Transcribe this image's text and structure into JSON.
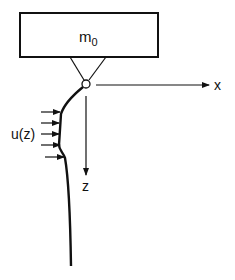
{
  "diagram": {
    "mass_label": "m",
    "mass_subscript": "0",
    "x_axis_label": "x",
    "z_axis_label": "z",
    "current_label": "u(z)",
    "colors": {
      "stroke": "#111111",
      "background": "#ffffff"
    }
  }
}
